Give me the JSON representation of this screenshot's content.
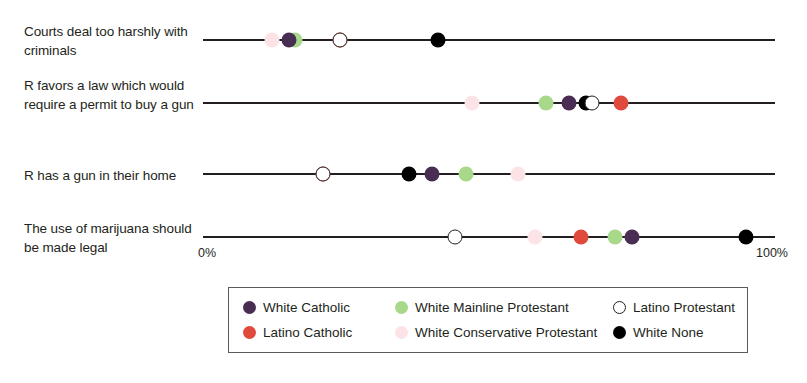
{
  "chart_data": {
    "type": "scatter",
    "title": "",
    "xlabel": "",
    "ylabel": "",
    "xlim": [
      0,
      100
    ],
    "grid": false,
    "legend_position": "bottom",
    "axis_start_label": "0%",
    "axis_end_label": "100%",
    "categories": [
      "Courts deal too harshly with criminals",
      "R favors a law which would require a permit to buy a gun",
      "R has a gun in their home",
      "The use of marijuana should be made legal"
    ],
    "series": [
      {
        "name": "White Catholic",
        "color": "#4a2d52",
        "style": "filled",
        "values": [
          15,
          64,
          40,
          75
        ]
      },
      {
        "name": "Latino Catholic",
        "color": "#e04a3c",
        "style": "filled",
        "values": [
          24,
          73,
          21,
          66
        ]
      },
      {
        "name": "White Mainline Protestant",
        "color": "#a8d88a",
        "style": "filled",
        "values": [
          16,
          60,
          46,
          72
        ]
      },
      {
        "name": "White Conservative Protestant",
        "color": "#fbe3e6",
        "style": "filled",
        "values": [
          12,
          47,
          55,
          58
        ]
      },
      {
        "name": "Latino Protestant",
        "color": "#ffffff",
        "style": "hollow",
        "values": [
          24,
          68,
          21,
          44
        ]
      },
      {
        "name": "White None",
        "color": "#000000",
        "style": "filled",
        "values": [
          41,
          67,
          36,
          95
        ]
      }
    ]
  },
  "rows": [
    {
      "label": "Courts deal too harshly with criminals"
    },
    {
      "label": "R favors a law which would require a permit to buy a gun"
    },
    {
      "label": "R has a gun in their home"
    },
    {
      "label": "The use of marijuana should be made legal"
    }
  ],
  "axis": {
    "start_label": "0%",
    "end_label": "100%"
  },
  "legend": {
    "entries": [
      {
        "label": "White Catholic",
        "color": "#4a2d52",
        "style": "filled"
      },
      {
        "label": "White Mainline Protestant",
        "color": "#a8d88a",
        "style": "filled"
      },
      {
        "label": "Latino Protestant",
        "color": "#ffffff",
        "style": "hollow"
      },
      {
        "label": "Latino Catholic",
        "color": "#e04a3c",
        "style": "filled"
      },
      {
        "label": "White Conservative Protestant",
        "color": "#fbe3e6",
        "style": "filled"
      },
      {
        "label": "White None",
        "color": "#000000",
        "style": "filled"
      }
    ]
  }
}
